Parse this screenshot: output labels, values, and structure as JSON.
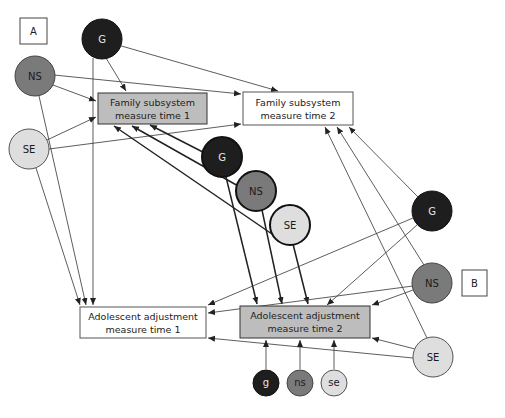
{
  "diagram": {
    "panel_labels": {
      "a": "A",
      "b": "B"
    },
    "colors": {
      "g": "#1e1e1e",
      "ns": "#7a7a7a",
      "se": "#dedede",
      "box_gray": "#bdbdbd",
      "box_white": "#ffffff",
      "line": "#333333"
    },
    "boxes": {
      "family_t1": {
        "line1": "Family subsystem",
        "line2": "measure time 1"
      },
      "family_t2": {
        "line1": "Family subsystem",
        "line2": "measure time 2"
      },
      "adol_t1": {
        "line1": "Adolescent adjustment",
        "line2": "measure time 1"
      },
      "adol_t2": {
        "line1": "Adolescent adjustment",
        "line2": "measure time 2"
      }
    },
    "nodes": {
      "g_top": "G",
      "ns_left": "NS",
      "se_left": "SE",
      "g_mid": "G",
      "ns_mid": "NS",
      "se_mid": "SE",
      "g_right": "G",
      "ns_right": "NS",
      "se_right": "SE",
      "g_small": "g",
      "ns_small": "ns",
      "se_small": "se"
    }
  }
}
